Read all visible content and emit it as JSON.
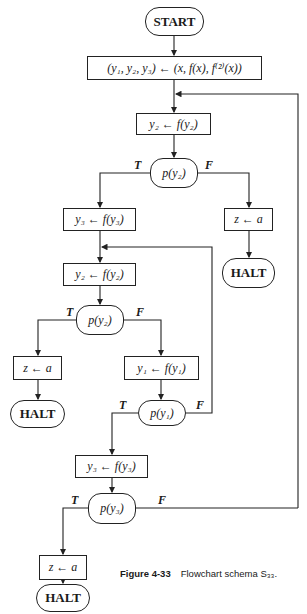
{
  "figure": {
    "header_fragment": "Sec. 4-3 ...",
    "caption_label": "Figure 4-33",
    "caption_text": "Flowchart schema S₃₃."
  },
  "nodes": {
    "start": "START",
    "init": "(y₁, y₂, y₃) ← (x, f(x), f⁽²⁾(x))",
    "assign_y2_top": "y₂ ← f(y₂)",
    "test_py2_top": "p(y₂)",
    "assign_y3_first": "y₃ ← f(y₃)",
    "assign_z_right": "z ← a",
    "halt_right": "HALT",
    "assign_y2_mid": "y₂ ← f(y₂)",
    "test_py2_mid": "p(y₂)",
    "assign_z_left": "z ← a",
    "halt_left": "HALT",
    "assign_y1": "y₁ ← f(y₁)",
    "test_py1": "p(y₁)",
    "assign_y3_second": "y₃ ← f(y₃)",
    "test_py3": "p(y₃)",
    "assign_z_bottom": "z ← a",
    "halt_bottom": "HALT"
  },
  "branch_labels": {
    "true": "T",
    "false": "F"
  }
}
